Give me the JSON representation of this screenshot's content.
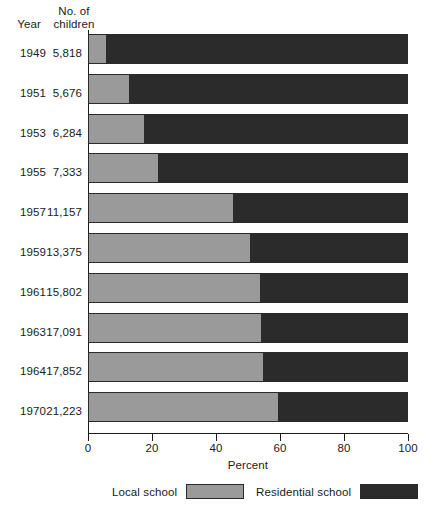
{
  "header": {
    "year_label": "Year",
    "children_label": "No. of\nchildren"
  },
  "legend": {
    "local_label": "Local school",
    "residential_label": "Residential school",
    "local_color": "#9a9a9a",
    "residential_color": "#2b2b2b"
  },
  "axis": {
    "title": "Percent",
    "ticks": [
      "0",
      "20",
      "40",
      "60",
      "80",
      "100"
    ]
  },
  "rows": [
    {
      "year": "1949",
      "children": "5,818"
    },
    {
      "year": "1951",
      "children": "5,676"
    },
    {
      "year": "1953",
      "children": "6,284"
    },
    {
      "year": "1955",
      "children": "7,333"
    },
    {
      "year": "1957",
      "children": "11,157"
    },
    {
      "year": "1959",
      "children": "13,375"
    },
    {
      "year": "1961",
      "children": "15,802"
    },
    {
      "year": "1963",
      "children": "17,091"
    },
    {
      "year": "1964",
      "children": "17,852"
    },
    {
      "year": "1970",
      "children": "21,223"
    }
  ],
  "chart_data": {
    "type": "bar",
    "orientation": "horizontal",
    "stacked": true,
    "title": "",
    "xlabel": "Percent",
    "ylabel": "Year",
    "xlim": [
      0,
      100
    ],
    "xticks": [
      0,
      20,
      40,
      60,
      80,
      100
    ],
    "grid": false,
    "legend_position": "bottom",
    "categories": [
      "1949",
      "1951",
      "1953",
      "1955",
      "1957",
      "1959",
      "1961",
      "1963",
      "1964",
      "1970"
    ],
    "secondary_labels": {
      "name": "No. of children",
      "values": [
        "5,818",
        "5,676",
        "6,284",
        "7,333",
        "11,157",
        "13,375",
        "15,802",
        "17,091",
        "17,852",
        "21,223"
      ]
    },
    "series": [
      {
        "name": "Local school",
        "color": "#9a9a9a",
        "values": [
          5.6,
          12.8,
          17.5,
          21.9,
          45.3,
          50.6,
          53.8,
          54.0,
          54.7,
          59.4
        ]
      },
      {
        "name": "Residential school",
        "color": "#2b2b2b",
        "values": [
          94.4,
          87.2,
          82.5,
          78.1,
          54.7,
          49.4,
          46.2,
          46.0,
          45.3,
          40.6
        ]
      }
    ]
  }
}
